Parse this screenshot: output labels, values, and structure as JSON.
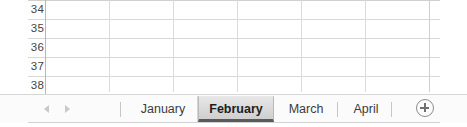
{
  "app": {
    "name": "spreadsheet-worksheet-bottom"
  },
  "grid": {
    "row_headers": [
      "34",
      "35",
      "36",
      "37",
      "38"
    ],
    "column_count": 7,
    "gridline_color": "#d8d8d8",
    "header_divider_color": "#b7b7b7",
    "cells": [
      [
        "",
        "",
        "",
        "",
        "",
        "",
        ""
      ],
      [
        "",
        "",
        "",
        "",
        "",
        "",
        ""
      ],
      [
        "",
        "",
        "",
        "",
        "",
        "",
        ""
      ],
      [
        "",
        "",
        "",
        "",
        "",
        "",
        ""
      ],
      [
        "",
        "",
        "",
        "",
        "",
        "",
        ""
      ]
    ]
  },
  "tab_bar": {
    "nav": {
      "prev_icon": "triangle-left-icon",
      "next_icon": "triangle-right-icon",
      "arrow_color": "#c9c9c9"
    },
    "tabs": [
      {
        "label": "January",
        "active": false
      },
      {
        "label": "February",
        "active": true
      },
      {
        "label": "March",
        "active": false
      },
      {
        "label": "April",
        "active": false
      }
    ],
    "active_tab": "February",
    "active_tab_underline_color": "#5a5a5a",
    "add_sheet": {
      "icon": "plus-circle-icon",
      "label": "+"
    },
    "background": "#fbfbfb"
  }
}
